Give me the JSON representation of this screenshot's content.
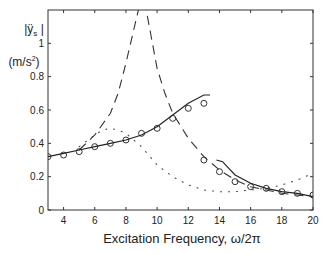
{
  "chart_data": {
    "type": "line",
    "title": "",
    "xlabel": "Excitation Frequency, ω/2π",
    "ylabel_line1": "|ÿs|",
    "ylabel_line2": "(m/s²)",
    "xlim": [
      3,
      20
    ],
    "ylim": [
      0,
      1.2
    ],
    "xticks": [
      4,
      6,
      8,
      10,
      12,
      14,
      16,
      18,
      20
    ],
    "yticks": [
      0,
      0.2,
      0.4,
      0.6,
      0.8,
      1
    ],
    "ytick_labels": [
      "0",
      "0.2",
      "0.4",
      "0.6",
      "0.8",
      "1"
    ],
    "grid": false,
    "legend": "none",
    "series": [
      {
        "name": "measured",
        "style": "circles",
        "x": [
          3,
          4,
          5,
          6,
          7,
          8,
          9,
          10,
          11,
          12,
          13,
          13,
          14,
          15,
          16,
          17,
          18,
          19,
          20
        ],
        "y": [
          0.32,
          0.33,
          0.35,
          0.38,
          0.4,
          0.42,
          0.46,
          0.49,
          0.55,
          0.61,
          0.64,
          0.3,
          0.23,
          0.17,
          0.14,
          0.13,
          0.11,
          0.1,
          0.09
        ]
      },
      {
        "name": "solid",
        "style": "solid",
        "segments": [
          {
            "x": [
              3,
              4,
              5,
              6,
              7,
              8,
              9,
              10,
              11,
              12,
              13,
              13.4
            ],
            "y": [
              0.32,
              0.34,
              0.36,
              0.38,
              0.4,
              0.42,
              0.45,
              0.5,
              0.57,
              0.64,
              0.69,
              0.69
            ]
          },
          {
            "x": [
              13.8,
              14.2,
              14.6,
              15,
              16,
              17,
              18,
              19,
              20
            ],
            "y": [
              0.3,
              0.29,
              0.25,
              0.21,
              0.16,
              0.13,
              0.11,
              0.1,
              0.08
            ]
          }
        ]
      },
      {
        "name": "dashed",
        "style": "dashed",
        "x": [
          5,
          6,
          7,
          7.5,
          8,
          8.5,
          8.8,
          9.0,
          9.3,
          9.6,
          10,
          10.5,
          11,
          12,
          13,
          14,
          15,
          16,
          17,
          18,
          19,
          20
        ],
        "y": [
          0.36,
          0.45,
          0.58,
          0.7,
          0.88,
          1.08,
          1.2,
          1.25,
          1.2,
          1.05,
          0.85,
          0.7,
          0.58,
          0.43,
          0.32,
          0.24,
          0.18,
          0.14,
          0.12,
          0.1,
          0.09,
          0.08
        ]
      },
      {
        "name": "dotted",
        "style": "dotted",
        "x": [
          5,
          6,
          6.5,
          7,
          7.5,
          8,
          9,
          10,
          11,
          12,
          13,
          14,
          15,
          16,
          17,
          18,
          19,
          20
        ],
        "y": [
          0.38,
          0.45,
          0.48,
          0.49,
          0.48,
          0.46,
          0.38,
          0.27,
          0.2,
          0.15,
          0.12,
          0.11,
          0.11,
          0.12,
          0.13,
          0.15,
          0.18,
          0.22
        ]
      }
    ]
  }
}
